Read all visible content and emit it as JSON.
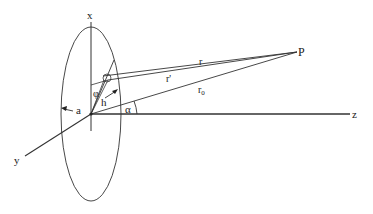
{
  "diagram": {
    "type": "geometry",
    "labels": {
      "x_axis": "x",
      "y_axis": "y",
      "z_axis": "z",
      "point": "P",
      "r": "r",
      "r_prime": "r'",
      "r0": "r",
      "r0_sub": "0",
      "radius": "a",
      "h": "h",
      "phi": "φ",
      "alpha": "α"
    }
  }
}
